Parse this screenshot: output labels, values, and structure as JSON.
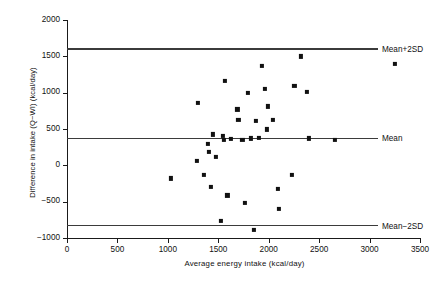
{
  "chart_data": {
    "type": "scatter",
    "title": "",
    "xlabel": "Average energy intake (kcal/day)",
    "ylabel": "Difference in intake (Q−WI) (kcal/day)",
    "xlim": [
      0,
      3500
    ],
    "ylim": [
      -1000,
      2000
    ],
    "xticks": [
      0,
      500,
      1000,
      1500,
      2000,
      2500,
      3000,
      3500
    ],
    "yticks": [
      -1000,
      -500,
      0,
      500,
      1000,
      1500,
      2000
    ],
    "xtick_labels": [
      "0",
      "500",
      "1000",
      "1500",
      "2000",
      "2500",
      "3000",
      "3500"
    ],
    "ytick_labels": [
      "−1000",
      "−500",
      "0",
      "500",
      "1000",
      "1500",
      "2000"
    ],
    "grid": false,
    "legend": "none",
    "reference_lines": [
      {
        "name": "mean-plus-2sd-line",
        "label": "Mean+2SD",
        "value": 1600
      },
      {
        "name": "mean-line",
        "label": "Mean",
        "value": 370
      },
      {
        "name": "mean-minus-2sd-line",
        "label": "Mean−2SD",
        "value": -830
      }
    ],
    "series": [
      {
        "name": "energy-intake-difference",
        "marker": "square",
        "color": "#111111",
        "points": [
          [
            1030,
            -180
          ],
          [
            1285,
            60
          ],
          [
            1300,
            860
          ],
          [
            1355,
            -135
          ],
          [
            1400,
            300
          ],
          [
            1405,
            180
          ],
          [
            1425,
            -295
          ],
          [
            1450,
            425
          ],
          [
            1480,
            120
          ],
          [
            1530,
            -760
          ],
          [
            1545,
            400
          ],
          [
            1555,
            355
          ],
          [
            1565,
            1160
          ],
          [
            1590,
            -415
          ],
          [
            1625,
            360
          ],
          [
            1690,
            770
          ],
          [
            1700,
            625
          ],
          [
            1740,
            355
          ],
          [
            1760,
            -520
          ],
          [
            1790,
            1000
          ],
          [
            1820,
            370
          ],
          [
            1850,
            -890
          ],
          [
            1875,
            615
          ],
          [
            1900,
            380
          ],
          [
            1930,
            1370
          ],
          [
            1960,
            1055
          ],
          [
            1980,
            495
          ],
          [
            1990,
            810
          ],
          [
            2040,
            630
          ],
          [
            2090,
            -325
          ],
          [
            2105,
            -600
          ],
          [
            2230,
            -130
          ],
          [
            2255,
            1090
          ],
          [
            2320,
            1500
          ],
          [
            2375,
            1015
          ],
          [
            2400,
            370
          ],
          [
            2660,
            345
          ],
          [
            3255,
            1395
          ]
        ]
      }
    ]
  }
}
